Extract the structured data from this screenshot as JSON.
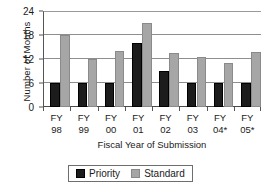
{
  "chart_data": {
    "type": "bar",
    "title": "",
    "xlabel": "Fiscal Year of Submission",
    "ylabel": "Number of Months",
    "categories": [
      "FY 98",
      "FY 99",
      "FY 00",
      "FY 01",
      "FY 02",
      "FY 03",
      "FY 04*",
      "FY 05*"
    ],
    "category_lines": [
      {
        "l1": "FY",
        "l2": "98"
      },
      {
        "l1": "FY",
        "l2": "99"
      },
      {
        "l1": "FY",
        "l2": "00"
      },
      {
        "l1": "FY",
        "l2": "01"
      },
      {
        "l1": "FY",
        "l2": "02"
      },
      {
        "l1": "FY",
        "l2": "03"
      },
      {
        "l1": "FY",
        "l2": "04*"
      },
      {
        "l1": "FY",
        "l2": "05*"
      }
    ],
    "series": [
      {
        "name": "Priority",
        "color": "#1c1c1c",
        "values": [
          6,
          6,
          6,
          16,
          9,
          6,
          6,
          6
        ]
      },
      {
        "name": "Standard",
        "color": "#a6a6a6",
        "values": [
          18,
          12,
          14,
          21,
          13.5,
          12.5,
          11,
          13.7
        ]
      }
    ],
    "ylim": [
      0,
      24
    ],
    "yticks": [
      0,
      6,
      12,
      18,
      24
    ],
    "ytick_labels": [
      "0",
      "6",
      "12",
      "18",
      "24"
    ],
    "grid": true,
    "legend_position": "bottom"
  },
  "legend": {
    "entries": [
      {
        "label": "Priority",
        "color": "#1c1c1c"
      },
      {
        "label": "Standard",
        "color": "#a6a6a6"
      }
    ]
  },
  "colors": {
    "priority": "#1c1c1c",
    "standard": "#a6a6a6",
    "axis": "#555555",
    "gridline": "#8e8e8e",
    "background": "#ffffff"
  }
}
